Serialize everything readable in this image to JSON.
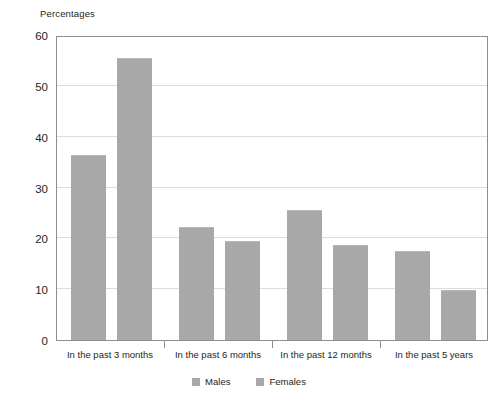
{
  "chart_data": {
    "type": "bar",
    "title": "",
    "axis_caption": "Percentages",
    "xlabel": "",
    "ylabel": "Percentages",
    "ylim": [
      0,
      60
    ],
    "ytick_step": 10,
    "yticks": [
      0,
      10,
      20,
      30,
      40,
      50,
      60
    ],
    "ytick_labels": [
      "0",
      "10",
      "20",
      "30",
      "40",
      "50",
      "60"
    ],
    "grid": true,
    "grid_axis": "y",
    "legend_position": "bottom",
    "categories": [
      "In the past 3 months",
      "In the past 6 months",
      "In the past 12 months",
      "In the past 5 years"
    ],
    "series": [
      {
        "name": "Males",
        "color": "#a8a8a8",
        "values": [
          36.3,
          22.3,
          25.5,
          17.6
        ]
      },
      {
        "name": "Females",
        "color": "#a8a8a8",
        "values": [
          55.5,
          19.5,
          18.7,
          9.8
        ]
      }
    ]
  },
  "colors": {
    "bar_fill": "#a8a8a8",
    "bar_top_edge": "#b9b9b9",
    "gridline": "#dcdcdc",
    "frame": "#8e8e8e",
    "text": "#231f20",
    "background": "#ffffff"
  }
}
